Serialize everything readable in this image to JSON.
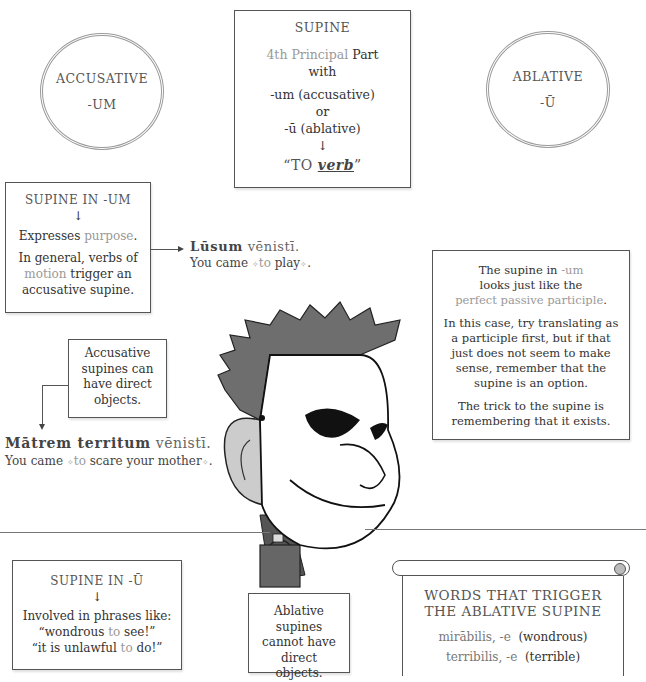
{
  "circles": {
    "accusative": {
      "line1": "ACCUSATIVE",
      "line2": "-UM"
    },
    "ablative": {
      "line1": "ABLATIVE",
      "line2": "-Ū"
    }
  },
  "supine_box": {
    "title": "SUPINE",
    "pp_highlight": "4th Principal",
    "pp_rest": "Part",
    "with": "with",
    "acc": "-um (accusative)",
    "or": "or",
    "abl": "-ū (ablative)",
    "arrow": "↓",
    "to_open": "“TO ",
    "verb": "verb",
    "to_close": "”"
  },
  "supine_um": {
    "title": "SUPINE IN -UM",
    "arrow": "↓",
    "purpose_pre": "Expresses ",
    "purpose_hl": "purpose",
    "purpose_post": ".",
    "general_1": "In general, verbs of",
    "motion_hl": "motion",
    "general_2": " trigger an",
    "general_3": "accusative supine."
  },
  "example_lusum": {
    "latin_bold": "Lūsum",
    "latin_light": " vēnistī.",
    "trans_pre": "You came ",
    "trans_hl": "to",
    "trans_rest": " play",
    "trans_end": "."
  },
  "ppp_note": {
    "line1_pre": "The supine in ",
    "line1_hl": "-um",
    "line2": "looks just like the",
    "line3_hl": "perfect passive participle",
    "line3_end": ".",
    "para2": "In this case, try translating as a participle first, but if that just does not seem to make sense, remember that the supine is an option.",
    "para3": "The trick to the supine is remembering that it exists."
  },
  "acc_direct": {
    "text": "Accusative supines can have direct objects."
  },
  "example_matrem": {
    "latin_bold": "Mātrem territum",
    "latin_light": " vēnistī.",
    "trans_pre": "You came ",
    "trans_hl": "to",
    "trans_rest": " scare your mother",
    "trans_end": "."
  },
  "supine_u": {
    "title": "SUPINE IN -Ū",
    "arrow": "↓",
    "line1": "Involved in phrases like:",
    "q1_pre": "“wondrous ",
    "q1_hl": "to",
    "q1_post": " see!”",
    "q2_pre": "“it is unlawful ",
    "q2_hl": "to",
    "q2_post": " do!”"
  },
  "abl_direct": {
    "text": "Ablative supines cannot have direct objects."
  },
  "scroll": {
    "title1": "WORDS THAT TRIGGER",
    "title2": "THE ABLATIVE SUPINE",
    "word1_light": "mirābilis, -e",
    "word1_dark": "(wondrous)",
    "word2_light": "terribilis, -e",
    "word2_dark": "(terrible)"
  },
  "sparkle": "✧"
}
